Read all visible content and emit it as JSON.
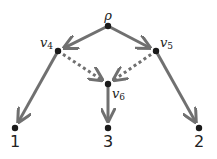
{
  "diagram": {
    "type": "directed-graph",
    "colors": {
      "edge": "#707070",
      "node": "#1a1a1a",
      "text": "#222222"
    },
    "nodes": [
      {
        "id": "rho",
        "label": "ρ",
        "sub": "",
        "x": 108,
        "y": 26
      },
      {
        "id": "v4",
        "label": "v",
        "sub": "4",
        "x": 58,
        "y": 51
      },
      {
        "id": "v5",
        "label": "v",
        "sub": "5",
        "x": 156,
        "y": 51
      },
      {
        "id": "v6",
        "label": "v",
        "sub": "6",
        "x": 108,
        "y": 84
      },
      {
        "id": "leaf1",
        "label": "1",
        "x": 15,
        "y": 128
      },
      {
        "id": "leaf3",
        "label": "3",
        "x": 108,
        "y": 128
      },
      {
        "id": "leaf2",
        "label": "2",
        "x": 199,
        "y": 128
      }
    ],
    "edges": [
      {
        "from": "rho",
        "to": "v4",
        "style": "solid"
      },
      {
        "from": "rho",
        "to": "v5",
        "style": "solid"
      },
      {
        "from": "v4",
        "to": "leaf1",
        "style": "solid"
      },
      {
        "from": "v5",
        "to": "leaf2",
        "style": "solid"
      },
      {
        "from": "v6",
        "to": "leaf3",
        "style": "solid"
      },
      {
        "from": "v4",
        "to": "v6",
        "style": "dotted"
      },
      {
        "from": "v5",
        "to": "v6",
        "style": "dotted"
      }
    ]
  }
}
